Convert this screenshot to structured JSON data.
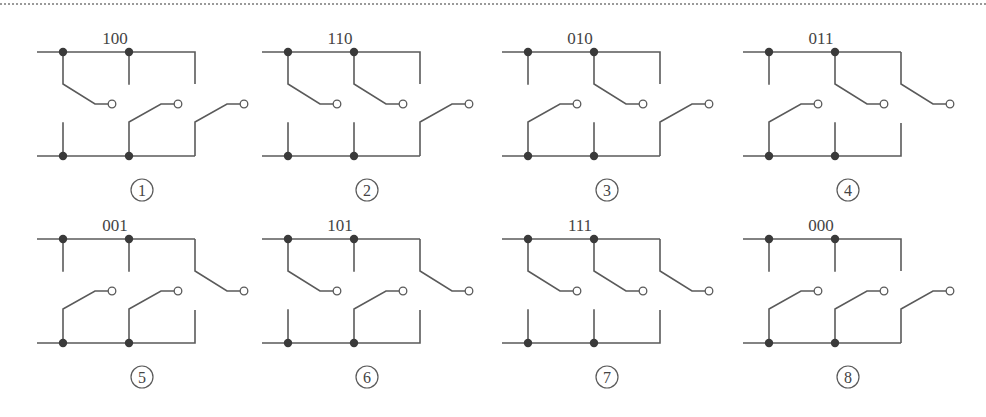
{
  "diagram": {
    "colors": {
      "line": "#5a5a5a",
      "junction": "#3a3a3a",
      "open_terminal_fill": "#ffffff",
      "text": "#444444"
    },
    "panels": [
      {
        "index": 1,
        "label": "①",
        "number": "1",
        "code": "100",
        "bits": [
          1,
          0,
          0
        ]
      },
      {
        "index": 2,
        "label": "②",
        "number": "2",
        "code": "110",
        "bits": [
          1,
          1,
          0
        ]
      },
      {
        "index": 3,
        "label": "③",
        "number": "3",
        "code": "010",
        "bits": [
          0,
          1,
          0
        ]
      },
      {
        "index": 4,
        "label": "④",
        "number": "4",
        "code": "011",
        "bits": [
          0,
          1,
          1
        ]
      },
      {
        "index": 5,
        "label": "⑤",
        "number": "5",
        "code": "001",
        "bits": [
          0,
          0,
          1
        ]
      },
      {
        "index": 6,
        "label": "⑥",
        "number": "6",
        "code": "101",
        "bits": [
          1,
          0,
          1
        ]
      },
      {
        "index": 7,
        "label": "⑦",
        "number": "7",
        "code": "111",
        "bits": [
          1,
          1,
          1
        ]
      },
      {
        "index": 8,
        "label": "⑧",
        "number": "8",
        "code": "000",
        "bits": [
          0,
          0,
          0
        ]
      }
    ],
    "legend": {
      "bit_1": "switch blade hinged on top rail",
      "bit_0": "switch blade hinged on bottom rail"
    }
  }
}
